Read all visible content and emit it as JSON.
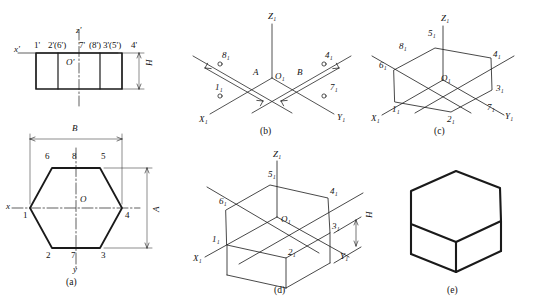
{
  "figure": {
    "stroke_color": "#1a1a1a",
    "panels": [
      {
        "id": "a",
        "caption": "(a)",
        "description": "Two orthographic views: front view (rectangle) above, top view (hexagon) below",
        "front_view": {
          "axis_labels": [
            "x'",
            "z'"
          ],
          "origin_label": "O'",
          "vertex_labels": [
            "1'",
            "2'(6')",
            "7'",
            "(8')",
            "3'(5')",
            "4'"
          ],
          "dimension_labels": [
            "H"
          ]
        },
        "top_view": {
          "axis_labels": [
            "x",
            "y"
          ],
          "origin_label": "O",
          "vertex_labels": [
            "1",
            "2",
            "3",
            "4",
            "5",
            "6",
            "7",
            "8"
          ],
          "dimension_labels": [
            "B",
            "A"
          ]
        }
      },
      {
        "id": "b",
        "caption": "(b)",
        "description": "Isometric axes with points 1,4,7,8 laid out along measured distances A and B",
        "axis_labels": [
          "X₁",
          "Y₁",
          "Z₁"
        ],
        "origin_label": "O₁",
        "point_labels": [
          "1₁",
          "4₁",
          "7₁",
          "8₁"
        ],
        "dimension_labels": [
          "A",
          "B"
        ]
      },
      {
        "id": "c",
        "caption": "(c)",
        "description": "Isometric hexagon completed through points 1 to 8",
        "axis_labels": [
          "X₁",
          "Y₁",
          "Z₁"
        ],
        "origin_label": "O₁",
        "point_labels": [
          "1₁",
          "2₁",
          "3₁",
          "4₁",
          "5₁",
          "6₁",
          "7₁",
          "8₁"
        ]
      },
      {
        "id": "d",
        "caption": "(d)",
        "description": "Vertical edges of height H projected downward from the hexagon",
        "axis_labels": [
          "X₁",
          "Y₁",
          "Z₁"
        ],
        "origin_label": "O₁",
        "point_labels": [
          "1₁",
          "2₁",
          "3₁",
          "4₁",
          "5₁",
          "6₁"
        ],
        "dimension_labels": [
          "H"
        ]
      },
      {
        "id": "e",
        "caption": "(e)",
        "description": "Finished hexagonal prism with construction lines removed and outlines darkened",
        "axis_labels": [],
        "point_labels": []
      }
    ]
  }
}
